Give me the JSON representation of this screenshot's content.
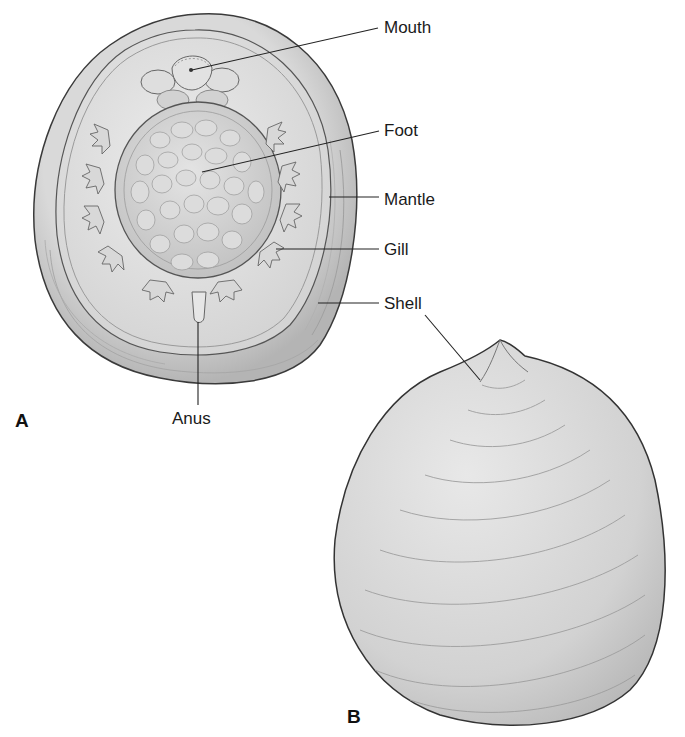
{
  "figure": {
    "panels": [
      {
        "id": "A",
        "label": "A",
        "description": "Ventral view of animal inside shell"
      },
      {
        "id": "B",
        "label": "B",
        "description": "Dorsal view of conical shell"
      }
    ],
    "labels": {
      "mouth": "Mouth",
      "foot": "Foot",
      "mantle": "Mantle",
      "gill": "Gill",
      "shell": "Shell",
      "anus": "Anus"
    },
    "colors": {
      "background": "#ffffff",
      "shell_fill": "#c9c9c9",
      "mantle_fill": "#e3e3e3",
      "foot_fill": "#d6d6d6",
      "outline": "#3a3a3a",
      "leader_line": "#222222"
    }
  }
}
